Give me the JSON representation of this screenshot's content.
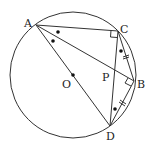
{
  "diagram": {
    "circle": {
      "center": "O",
      "cx": 73,
      "cy": 75,
      "r": 63
    },
    "points": [
      {
        "name": "A",
        "x": 36,
        "y": 25,
        "label": "A",
        "lx": 24,
        "ly": 25
      },
      {
        "name": "C",
        "x": 118,
        "y": 31,
        "label": "C",
        "lx": 120,
        "ly": 30
      },
      {
        "name": "B",
        "x": 134,
        "y": 81,
        "label": "B",
        "lx": 138,
        "ly": 85
      },
      {
        "name": "D",
        "x": 110,
        "y": 126,
        "label": "D",
        "lx": 106,
        "ly": 140
      },
      {
        "name": "O",
        "x": 73,
        "y": 75,
        "label": "O",
        "lx": 62,
        "ly": 87
      },
      {
        "name": "P",
        "x": 116,
        "y": 74,
        "label": "P",
        "lx": 101,
        "ly": 80
      }
    ],
    "segments": [
      "AC",
      "AB",
      "AD",
      "CB",
      "CD",
      "BD"
    ],
    "marks": {
      "right_angles": [
        "ACB",
        "ABD"
      ],
      "equal_arcs_ticks": [
        "CB",
        "BD"
      ],
      "equal_angle_dots": [
        "CAB",
        "BAD",
        "BCD",
        "BDC"
      ]
    }
  }
}
